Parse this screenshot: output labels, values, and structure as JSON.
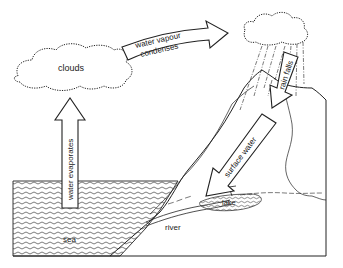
{
  "diagram": {
    "labels": {
      "clouds": "clouds",
      "condenses_line1": "water vapour",
      "condenses_line2": "condenses",
      "rain_falls": "rain falls",
      "surface_water": "surface water",
      "evaporates": "water evaporates",
      "sea": "sea",
      "river": "river",
      "lake": "lake"
    },
    "colors": {
      "line": "#222222",
      "background": "#ffffff"
    }
  }
}
